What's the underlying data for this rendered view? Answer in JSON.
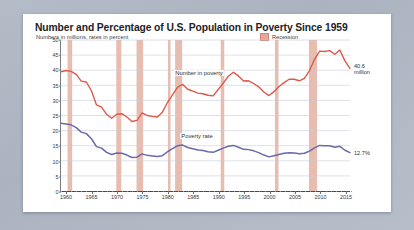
{
  "card": {
    "title": "Number and Percentage of U.S. Population in Poverty Since 1959",
    "subtitle": "Numbers in millions, rates in percent"
  },
  "legend": {
    "recession_label": "Recession",
    "recession_color": "#e3a898"
  },
  "annotations": {
    "number_end_line1": "40.6",
    "number_end_line2": "million",
    "rate_end": "12.7%",
    "series_label_number": "Number in poverty",
    "series_label_rate": "Poverty rate"
  },
  "colors": {
    "number_line": "#e0584a",
    "rate_line": "#6a6aa8",
    "recession_band": "#e0a797",
    "gridline": "#c8cdd6",
    "axis": "#4a4a4a",
    "card_background": "#ffffff",
    "page_background": "#aab4c0"
  },
  "chart_data": {
    "type": "line",
    "title": "Number and Percentage of U.S. Population in Poverty Since 1959",
    "subtitle": "Numbers in millions, rates in percent",
    "xlabel": "",
    "ylabel": "",
    "xlim": [
      1959,
      2016
    ],
    "ylim": [
      0,
      50
    ],
    "yticks": [
      0,
      5,
      10,
      15,
      20,
      25,
      30,
      35,
      40,
      45,
      50
    ],
    "xticks": [
      1960,
      1965,
      1970,
      1975,
      1980,
      1985,
      1990,
      1995,
      2000,
      2005,
      2010,
      2015
    ],
    "grid": true,
    "legend_position": "top-right",
    "x": [
      1959,
      1960,
      1961,
      1962,
      1963,
      1964,
      1965,
      1966,
      1967,
      1968,
      1969,
      1970,
      1971,
      1972,
      1973,
      1974,
      1975,
      1976,
      1977,
      1978,
      1979,
      1980,
      1981,
      1982,
      1983,
      1984,
      1985,
      1986,
      1987,
      1988,
      1989,
      1990,
      1991,
      1992,
      1993,
      1994,
      1995,
      1996,
      1997,
      1998,
      1999,
      2000,
      2001,
      2002,
      2003,
      2004,
      2005,
      2006,
      2007,
      2008,
      2009,
      2010,
      2011,
      2012,
      2013,
      2014,
      2015,
      2016
    ],
    "series": [
      {
        "name": "Number in poverty",
        "unit": "millions",
        "color": "#e0584a",
        "end_label": "40.6 million",
        "values": [
          39.5,
          39.9,
          39.6,
          38.6,
          36.4,
          36.1,
          33.2,
          28.5,
          27.8,
          25.4,
          24.1,
          25.4,
          25.6,
          24.5,
          23.0,
          23.4,
          25.9,
          25.0,
          24.7,
          24.5,
          26.1,
          29.3,
          31.8,
          34.4,
          35.3,
          33.7,
          33.1,
          32.4,
          32.2,
          31.7,
          31.5,
          33.6,
          35.7,
          38.0,
          39.3,
          38.1,
          36.4,
          36.5,
          35.6,
          34.5,
          32.8,
          31.6,
          32.9,
          34.6,
          35.9,
          37.0,
          37.0,
          36.5,
          37.3,
          39.8,
          43.6,
          46.3,
          46.2,
          46.5,
          45.3,
          46.7,
          43.1,
          40.6
        ]
      },
      {
        "name": "Poverty rate",
        "unit": "percent",
        "color": "#6a6aa8",
        "end_label": "12.7%",
        "values": [
          22.4,
          22.2,
          21.9,
          21.0,
          19.5,
          19.0,
          17.3,
          14.7,
          14.2,
          12.8,
          12.1,
          12.6,
          12.5,
          11.9,
          11.1,
          11.2,
          12.3,
          11.8,
          11.6,
          11.4,
          11.7,
          13.0,
          14.0,
          15.0,
          15.2,
          14.4,
          14.0,
          13.6,
          13.4,
          13.0,
          12.8,
          13.5,
          14.2,
          14.8,
          15.1,
          14.5,
          13.8,
          13.7,
          13.3,
          12.7,
          11.9,
          11.3,
          11.7,
          12.1,
          12.5,
          12.7,
          12.6,
          12.3,
          12.5,
          13.2,
          14.3,
          15.1,
          15.0,
          15.0,
          14.5,
          14.8,
          13.5,
          12.7
        ]
      }
    ],
    "recession_bands": [
      {
        "start": 1960.3,
        "end": 1961.2
      },
      {
        "start": 1969.9,
        "end": 1970.9
      },
      {
        "start": 1973.9,
        "end": 1975.2
      },
      {
        "start": 1980.1,
        "end": 1980.6
      },
      {
        "start": 1981.5,
        "end": 1982.9
      },
      {
        "start": 1990.5,
        "end": 1991.2
      },
      {
        "start": 2001.2,
        "end": 2001.9
      },
      {
        "start": 2007.9,
        "end": 2009.5
      }
    ]
  }
}
